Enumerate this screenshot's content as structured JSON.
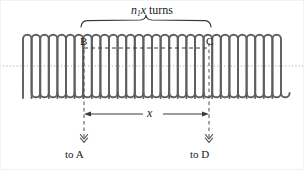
{
  "figure": {
    "type": "solenoid-coil-diagram",
    "background_color": "#ffffff",
    "coil_color": "#5a5a5a",
    "line_color": "#3a3a3a",
    "axis_color": "#b0a0a0"
  },
  "brace": {
    "label_prefix": "n",
    "label_subscript": "1",
    "label_variable": "x",
    "label_suffix": " turns",
    "full_text": "n1x turns",
    "span_start_px": 80,
    "span_end_px": 210
  },
  "points": {
    "b_label": "B",
    "c_label": "C",
    "b_x_px": 83,
    "c_x_px": 208
  },
  "dimension": {
    "label": "x",
    "start_px": 83,
    "end_px": 208,
    "y_px": 113
  },
  "terminals": [
    {
      "label": "to A",
      "x_px": 83
    },
    {
      "label": "to D",
      "x_px": 208
    }
  ],
  "coil": {
    "turns_visible": 30,
    "left_px": 22,
    "right_px": 282,
    "top_px": 33,
    "bottom_px": 97,
    "axis_y_px": 65
  }
}
